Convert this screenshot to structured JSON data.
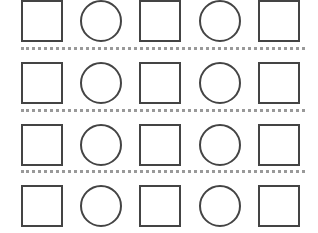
{
  "grid": {
    "rows": [
      [
        "square",
        "circle",
        "square",
        "circle",
        "square"
      ],
      [
        "square",
        "circle",
        "square",
        "circle",
        "square"
      ],
      [
        "square",
        "circle",
        "square",
        "circle",
        "square"
      ],
      [
        "square",
        "circle",
        "square",
        "circle",
        "square"
      ]
    ],
    "stroke_color": "#444444",
    "separator_color": "#999999"
  }
}
